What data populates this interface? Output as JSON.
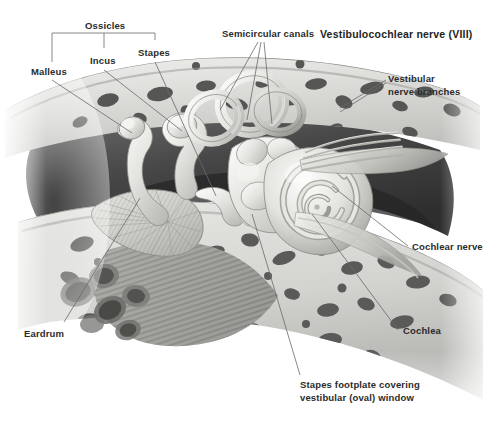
{
  "figure": {
    "title": "Vestibulocochlear nerve (VIII)",
    "style": "grayscale medical illustration"
  },
  "bracket": {
    "group_label": "Ossicles"
  },
  "labels": {
    "malleus": "Malleus",
    "incus": "Incus",
    "stapes": "Stapes",
    "semicircular_canals": "Semicircular canals",
    "vestibular_nerve_branches_line1": "Vestibular",
    "vestibular_nerve_branches_line2": "nerve branches",
    "cochlear_nerve": "Cochlear nerve",
    "cochlea": "Cochlea",
    "eardrum": "Eardrum",
    "stapes_footplate_line1": "Stapes footplate covering",
    "stapes_footplate_line2": "vestibular (oval) window"
  },
  "colors": {
    "background": "#ffffff",
    "text": "#2b2b2b",
    "title_text": "#1e1e1e",
    "leader_line": "#6a6a6a",
    "bone_light": "#d8d8d6",
    "bone_dark": "#5c5c5c",
    "cavity_dark": "#3a3a3a",
    "structure_light": "#efefec"
  }
}
